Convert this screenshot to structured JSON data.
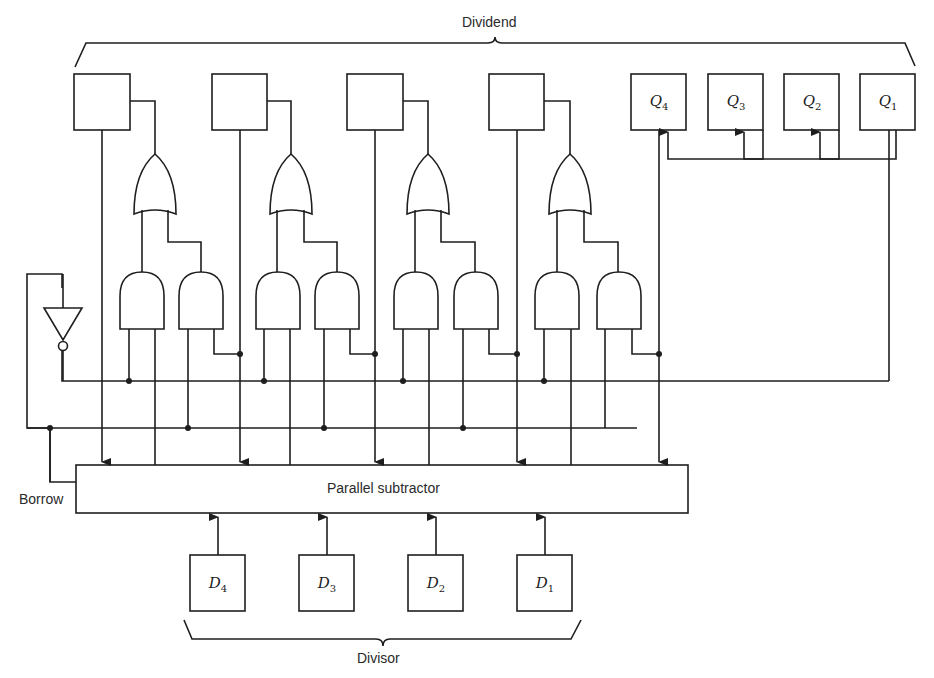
{
  "diagram": {
    "type": "logic-circuit",
    "labels": {
      "dividend": "Dividend",
      "divisor": "Divisor",
      "borrow": "Borrow",
      "subtractor": "Parallel subtractor"
    },
    "dividend_registers": [
      {
        "id": "A4",
        "label": ""
      },
      {
        "id": "A3",
        "label": ""
      },
      {
        "id": "A2",
        "label": ""
      },
      {
        "id": "A1",
        "label": ""
      }
    ],
    "quotient_registers": [
      {
        "var": "Q",
        "sub": "4"
      },
      {
        "var": "Q",
        "sub": "3"
      },
      {
        "var": "Q",
        "sub": "2"
      },
      {
        "var": "Q",
        "sub": "1"
      }
    ],
    "divisor_registers": [
      {
        "var": "D",
        "sub": "4"
      },
      {
        "var": "D",
        "sub": "3"
      },
      {
        "var": "D",
        "sub": "2"
      },
      {
        "var": "D",
        "sub": "1"
      }
    ],
    "gates": {
      "or_count": 4,
      "and_count": 8,
      "not_count": 1
    },
    "colors": {
      "line": "#1e1e1e",
      "background": "#ffffff"
    }
  }
}
